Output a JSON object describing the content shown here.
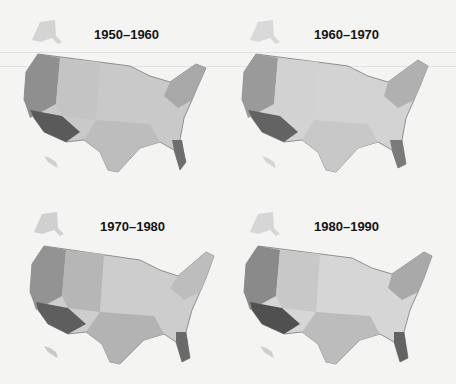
{
  "maps": [
    {
      "title": "1950–1960",
      "regions": {
        "west": "#8f8f8f",
        "southwest": "#5a5a5a",
        "mountain": "#c4c4c4",
        "plains": "#d8d8d8",
        "midwest": "#c9c9c9",
        "south": "#bdbdbd",
        "northeast": "#a8a8a8",
        "florida": "#6e6e6e",
        "alaska": "#d4d4d4",
        "hawaii": "#cfcfcf"
      }
    },
    {
      "title": "1960–1970",
      "regions": {
        "west": "#9a9a9a",
        "southwest": "#636363",
        "mountain": "#d2d2d2",
        "plains": "#e3e3e3",
        "midwest": "#d3d3d3",
        "south": "#c8c8c8",
        "northeast": "#b0b0b0",
        "florida": "#7a7a7a",
        "alaska": "#d9d9d9",
        "hawaii": "#d3d3d3"
      }
    },
    {
      "title": "1970–1980",
      "regions": {
        "west": "#939393",
        "southwest": "#5e5e5e",
        "mountain": "#b6b6b6",
        "plains": "#d6d6d6",
        "midwest": "#cdcdcd",
        "south": "#b3b3b3",
        "northeast": "#bdbdbd",
        "florida": "#6a6a6a",
        "alaska": "#d0d0d0",
        "hawaii": "#c8c8c8"
      }
    },
    {
      "title": "1980–1990",
      "regions": {
        "west": "#8a8a8a",
        "southwest": "#505050",
        "mountain": "#c8c8c8",
        "plains": "#e0e0e0",
        "midwest": "#d6d6d6",
        "south": "#bcbcbc",
        "northeast": "#a9a9a9",
        "florida": "#636363",
        "alaska": "#d6d6d6",
        "hawaii": "#cfcfcf"
      }
    }
  ]
}
